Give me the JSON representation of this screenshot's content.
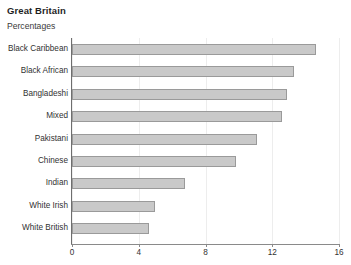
{
  "chart_data": {
    "type": "bar",
    "orientation": "horizontal",
    "title": "Great Britain",
    "subtitle": "Percentages",
    "xlabel": "",
    "ylabel": "",
    "categories": [
      "Black Caribbean",
      "Black African",
      "Bangladeshi",
      "Mixed",
      "Pakistani",
      "Chinese",
      "Indian",
      "White Irish",
      "White British"
    ],
    "values": [
      14.6,
      13.3,
      12.9,
      12.6,
      11.1,
      9.8,
      6.8,
      5.0,
      4.6
    ],
    "xlim": [
      0,
      16
    ],
    "xticks": [
      0,
      4,
      8,
      12,
      16
    ],
    "xtick_labels": [
      "0",
      "4",
      "8",
      "12",
      "16"
    ],
    "grid": "vertical",
    "legend": "none",
    "bar_fill_color": "#c9c9c9",
    "bar_border_color": "#9a9a9a",
    "background_color": "#ffffff",
    "axis_color": "#6e6e6e",
    "gridline_color": "#ededed"
  }
}
